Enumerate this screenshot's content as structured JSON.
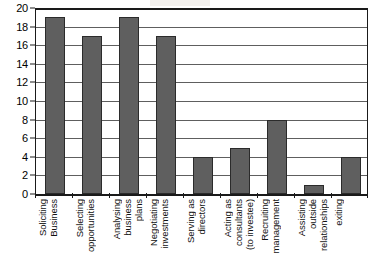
{
  "chart_data": {
    "type": "bar",
    "title": "",
    "subtitle": "",
    "xlabel": "",
    "ylabel": "",
    "ylim": [
      0,
      20
    ],
    "ytick_step": 2,
    "yticks": [
      20,
      18,
      16,
      14,
      12,
      10,
      8,
      6,
      4,
      2,
      0
    ],
    "grid": true,
    "grid_axis": "y",
    "legend": false,
    "legend_position": "none",
    "bar_color": "#5f5f5f",
    "bar_edge_color": "#2b2b2b",
    "axis_color": "#1a1a1a",
    "gridline_color": "#5e5e5e",
    "background_color": "#ffffff",
    "categories": [
      "Soliciting Business",
      "Selecting opportunities",
      "Analysing business plans",
      "Negotiating investments",
      "Serving as directors",
      "Acting as consultants (to investee)",
      "Recruiting management",
      "Assisting outside relationships",
      "exiting"
    ],
    "category_lines": [
      [
        "Soliciting",
        "Business"
      ],
      [
        "Selecting",
        "opportunities"
      ],
      [
        "Analysing",
        "business",
        "plans"
      ],
      [
        "Negotiating",
        "investments"
      ],
      [
        "Serving as",
        "directors"
      ],
      [
        "Acting as",
        "consultants",
        "(to investee)"
      ],
      [
        "Recruiting",
        "management"
      ],
      [
        "Assisting",
        "outside",
        "relationships"
      ],
      [
        "exiting"
      ]
    ],
    "values": [
      19,
      17,
      19,
      17,
      4,
      5,
      8,
      1,
      4
    ]
  }
}
